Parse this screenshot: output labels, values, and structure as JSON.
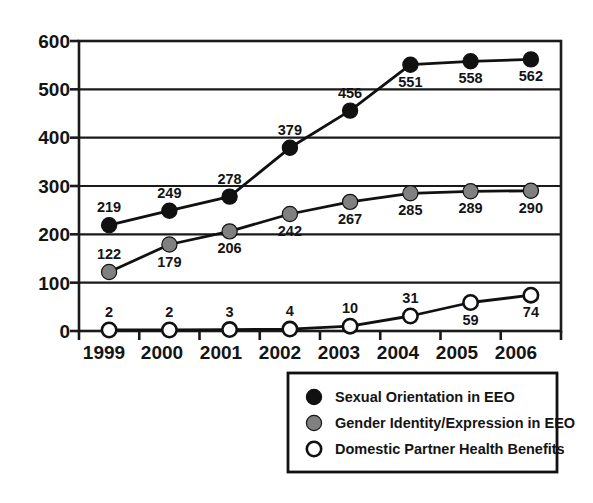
{
  "chart_data": {
    "type": "line",
    "title": "",
    "subtitle": "",
    "xlabel": "",
    "ylabel": "",
    "categories": [
      "1999",
      "2000",
      "2001",
      "2002",
      "2003",
      "2004",
      "2005",
      "2006"
    ],
    "ylim": [
      0,
      600
    ],
    "xlim_categories": [
      "1999",
      "2006"
    ],
    "y_ticks": [
      "0",
      "100",
      "200",
      "300",
      "400",
      "500",
      "600"
    ],
    "grid": "horizontal",
    "legend_position": "bottom-right",
    "series": [
      {
        "name": "Sexual Orientation in EEO",
        "marker": "filled-circle",
        "color": "#111111",
        "values": [
          219,
          249,
          278,
          379,
          456,
          551,
          558,
          562
        ],
        "labels": [
          "219",
          "249",
          "278",
          "379",
          "456",
          "551",
          "558",
          "562"
        ],
        "label_positions": [
          "above",
          "above",
          "above",
          "above",
          "above",
          "below",
          "below",
          "below"
        ]
      },
      {
        "name": "Gender Identity/Expression in EEO",
        "marker": "filled-circle",
        "color": "#808080",
        "values": [
          122,
          179,
          206,
          242,
          267,
          285,
          289,
          290
        ],
        "labels": [
          "122",
          "179",
          "206",
          "242",
          "267",
          "285",
          "289",
          "290"
        ],
        "label_positions": [
          "above",
          "below",
          "below",
          "below",
          "below",
          "below",
          "below",
          "below"
        ]
      },
      {
        "name": "Domestic Partner Health Benefits",
        "marker": "open-circle",
        "color": "#ffffff",
        "values": [
          2,
          2,
          3,
          4,
          10,
          31,
          59,
          74
        ],
        "labels": [
          "2",
          "2",
          "3",
          "4",
          "10",
          "31",
          "59",
          "74"
        ],
        "label_positions": [
          "above",
          "above",
          "above",
          "above",
          "above",
          "above",
          "below",
          "below"
        ]
      }
    ]
  },
  "axis": {
    "y_tick_0": "0",
    "y_tick_100": "100",
    "y_tick_200": "200",
    "y_tick_300": "300",
    "y_tick_400": "400",
    "y_tick_500": "500",
    "y_tick_600": "600",
    "x_tick_1999": "1999",
    "x_tick_2000": "2000",
    "x_tick_2001": "2001",
    "x_tick_2002": "2002",
    "x_tick_2003": "2003",
    "x_tick_2004": "2004",
    "x_tick_2005": "2005",
    "x_tick_2006": "2006"
  },
  "legend": {
    "entries": [
      {
        "label": "Sexual Orientation in EEO",
        "marker": "filled-circle",
        "color": "#111111"
      },
      {
        "label": "Gender Identity/Expression in EEO",
        "marker": "filled-circle",
        "color": "#808080"
      },
      {
        "label": "Domestic Partner Health Benefits",
        "marker": "open-circle",
        "color": "#ffffff"
      }
    ]
  },
  "colors": {
    "series_black": "#111111",
    "series_gray": "#808080",
    "series_white": "#ffffff",
    "axis": "#1a1a1a",
    "grid": "#1a1a1a",
    "background": "#ffffff"
  }
}
